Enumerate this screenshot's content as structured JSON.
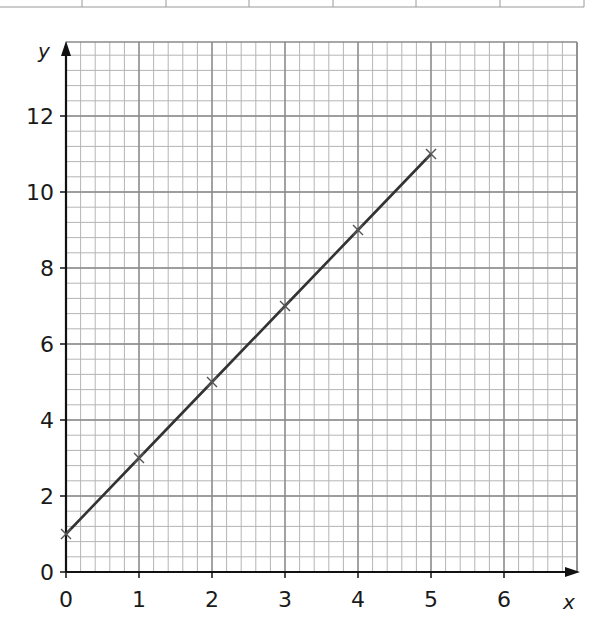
{
  "chart_data": {
    "type": "line",
    "title": "",
    "xlabel": "x",
    "ylabel": "y",
    "xlim": [
      0,
      6.5
    ],
    "ylim": [
      0,
      13.8
    ],
    "x_ticks": [
      "0",
      "1",
      "2",
      "3",
      "4",
      "5",
      "6"
    ],
    "y_ticks": [
      "0",
      "2",
      "4",
      "6",
      "8",
      "10",
      "12"
    ],
    "grid": true,
    "grid_minor": {
      "x_step": 0.2,
      "y_step": 0.4
    },
    "legend": null,
    "series": [
      {
        "name": "y = 2x + 1",
        "x": [
          0,
          1,
          2,
          3,
          4,
          5
        ],
        "y": [
          1,
          3,
          5,
          7,
          9,
          11
        ],
        "marker": "x",
        "color": "#333333"
      }
    ]
  },
  "top_table": {
    "columns": 7,
    "visible": "bottom edge only, cells empty"
  },
  "colors": {
    "grid_major": "#8a8a8a",
    "grid_minor": "#b5b5b5",
    "axis": "#111111",
    "line": "#333333"
  }
}
